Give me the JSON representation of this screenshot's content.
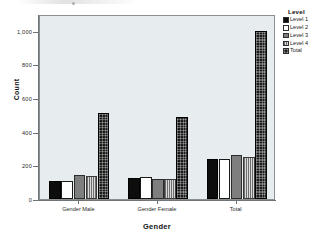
{
  "chart_data": {
    "type": "bar",
    "title": "",
    "xlabel": "Gender",
    "ylabel": "Count",
    "categories": [
      "Gender Male",
      "Gender Female",
      "Total"
    ],
    "series": [
      {
        "name": "Level 1",
        "values": [
          110,
          122,
          237
        ],
        "color": "#0d0d0d",
        "fill": "solid-black"
      },
      {
        "name": "Level 2",
        "values": [
          110,
          128,
          240
        ],
        "color": "#ffffff",
        "fill": "solid-white"
      },
      {
        "name": "Level 3",
        "values": [
          145,
          120,
          262
        ],
        "color": "#7e7e7e",
        "fill": "solid-gray"
      },
      {
        "name": "Level 4",
        "values": [
          135,
          118,
          250
        ],
        "color": "#d9d9d9",
        "fill": "vertical-line-hatch"
      },
      {
        "name": "Total",
        "values": [
          510,
          490,
          1000
        ],
        "color": "#1b1b1b",
        "fill": "checker-hatch"
      }
    ],
    "ylim": [
      0,
      1100
    ],
    "yticks": [
      0,
      200,
      400,
      600,
      800,
      1000
    ],
    "ytick_labels": [
      "0",
      "200",
      "400",
      "600",
      "800",
      "1,000"
    ],
    "grid": false,
    "legend_position": "right",
    "legend_title": "Level",
    "plot_background": "#e7ecee"
  },
  "legend": {
    "title": "Level",
    "items": [
      {
        "label": "Level 1"
      },
      {
        "label": "Level 2"
      },
      {
        "label": "Level 3"
      },
      {
        "label": "Level 4"
      },
      {
        "label": "Total"
      }
    ]
  },
  "axes": {
    "y_title": "Count",
    "x_title": "Gender"
  }
}
